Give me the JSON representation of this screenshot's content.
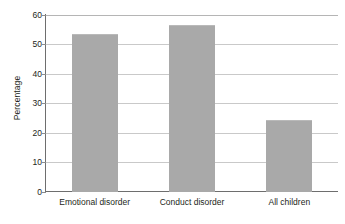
{
  "chart_data": {
    "type": "bar",
    "title": "",
    "xlabel": "",
    "ylabel": "Percentage",
    "categories": [
      "Emotional disorder",
      "Conduct disorder",
      "All children"
    ],
    "values": [
      53,
      56,
      24
    ],
    "ylim": [
      0,
      60
    ],
    "yticks": [
      0,
      10,
      20,
      30,
      40,
      50,
      60
    ],
    "ytick_labels": [
      "0",
      "10",
      "20",
      "30",
      "40",
      "50",
      "60"
    ],
    "grid": "horizontal",
    "legend": "none",
    "series": [
      {
        "name": "Percentage",
        "values": [
          53,
          56,
          24
        ],
        "color": "#a9a9a9"
      }
    ],
    "colors": {
      "bar_fill": "#a9a9a9",
      "gridline": "#c9c9c9",
      "axis_line": "#6e6e6e",
      "text": "#231f20",
      "background": "#ffffff"
    }
  }
}
